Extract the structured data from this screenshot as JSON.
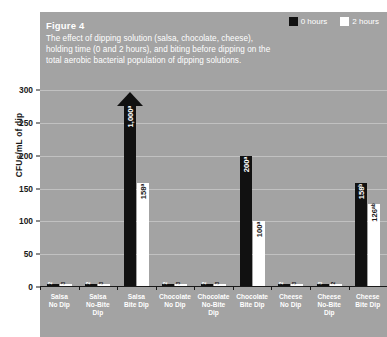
{
  "figure": {
    "title": "Figure 4",
    "caption": "The effect of dipping solution (salsa, chocolate, cheese), holding time (0 and 2 hours), and biting before dipping on the total aerobic bacterial population of dipping solutions.",
    "panel_color": "#a3a3a3",
    "caption_color": "#ffffff"
  },
  "legend": {
    "position": "top-right",
    "items": [
      {
        "label": "0 hours",
        "color": "#111111",
        "name": "series-0-hours"
      },
      {
        "label": "2 hours",
        "color": "#ffffff",
        "name": "series-2-hours"
      }
    ]
  },
  "chart_data": {
    "type": "bar",
    "title": "Figure 4",
    "subtitle": "The effect of dipping solution (salsa, chocolate, cheese), holding time (0 and 2 hours), and biting before dipping on the total aerobic bacterial population of dipping solutions.",
    "xlabel": "",
    "ylabel": "CFUs/mL of dip",
    "ylim": [
      0,
      300
    ],
    "yticks": [
      0,
      50,
      100,
      150,
      200,
      250,
      300
    ],
    "grid": true,
    "legend_position": "top-right",
    "categories": [
      "Salsa\nNo Dip",
      "Salsa\nNo-Bite\nDip",
      "Salsa\nBite Dip",
      "Chocolate\nNo Dip",
      "Chocolate\nNo-Bite\nDip",
      "Chocolate\nBite Dip",
      "Cheese\nNo Dip",
      "Cheese\nNo-Bite\nDip",
      "Cheese\nBite Dip"
    ],
    "series": [
      {
        "name": "0 hours",
        "color": "#111111",
        "values": [
          2,
          2,
          1000,
          2,
          2,
          200,
          2,
          3,
          158
        ],
        "labels": [
          "2",
          "2",
          "1,000ᵃ",
          "2",
          "2",
          "200ᵃ",
          "2",
          "3",
          "158ᵇ"
        ],
        "off_scale": [
          false,
          false,
          true,
          false,
          false,
          false,
          false,
          false,
          false
        ]
      },
      {
        "name": "2 hours",
        "color": "#ffffff",
        "values": [
          3,
          3,
          158,
          3,
          3,
          100,
          3,
          2,
          126
        ],
        "labels": [
          "3",
          "3",
          "158ᵃ",
          "3",
          "3",
          "100ᵃ",
          "3",
          "2",
          "126ᵃᵇ"
        ],
        "off_scale": [
          false,
          false,
          false,
          false,
          false,
          false,
          false,
          false,
          false
        ]
      }
    ],
    "annotations": [
      "Arrow on Salsa Bite Dip 0-hours bar indicates value exceeds axis maximum"
    ]
  }
}
